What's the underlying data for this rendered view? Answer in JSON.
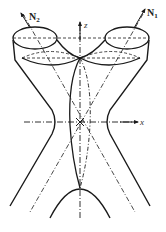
{
  "diagram": {
    "type": "geometric-figure",
    "labels": {
      "n1_main": "N",
      "n1_sub": "1",
      "n2_main": "N",
      "n2_sub": "2",
      "z_axis": "z",
      "x_axis": "x"
    },
    "colors": {
      "stroke": "#1a1a1a",
      "background": "#ffffff"
    }
  }
}
